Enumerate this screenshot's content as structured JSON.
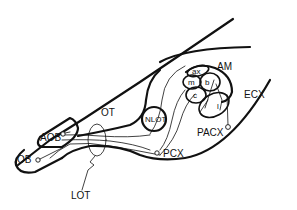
{
  "diagram": {
    "type": "neuroanatomy schematic",
    "labels": {
      "ob": "OB",
      "aob": "AOB",
      "ot": "OT",
      "nlot": "NLOT",
      "am": "AM",
      "ecx": "ECX",
      "pacx": "PACX",
      "pcx": "PCX",
      "lot": "LOT",
      "amygdala_subnuclei": {
        "ax": "ax",
        "m": "m",
        "b": "b",
        "c": "c",
        "l": "l"
      }
    },
    "colors": {
      "stroke": "#111111",
      "background": "#ffffff"
    }
  }
}
